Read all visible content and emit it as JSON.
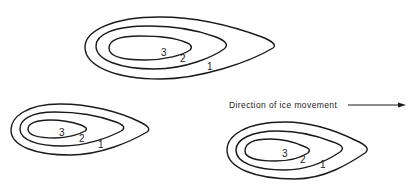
{
  "figure": {
    "caption": "Direction of ice movement",
    "colors": {
      "line": "#1a1a1a",
      "text": "#222222",
      "background": "#ffffff"
    },
    "drumlins": [
      {
        "id": "top",
        "contour_labels": [
          "1",
          "2",
          "3"
        ]
      },
      {
        "id": "bottom-left",
        "contour_labels": [
          "1",
          "2",
          "3"
        ]
      },
      {
        "id": "bottom-right",
        "contour_labels": [
          "1",
          "2",
          "3"
        ]
      }
    ]
  }
}
